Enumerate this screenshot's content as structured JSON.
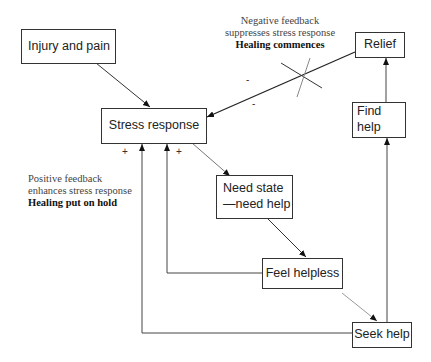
{
  "diagram": {
    "nodes": {
      "injury": "Injury and pain",
      "stress": "Stress response",
      "relief": "Relief",
      "find_help": "Find help",
      "need_state_line1": "Need state",
      "need_state_line2": "—need help",
      "feel_helpless": "Feel helpless",
      "seek_help": "Seek help"
    },
    "annotations": {
      "negative": {
        "line1": "Negative feedback",
        "line2": "suppresses stress response",
        "line3": "Healing commences"
      },
      "positive": {
        "line1": "Positive feedback",
        "line2": "enhances stress response",
        "line3": "Healing put on hold"
      }
    },
    "signs": {
      "plus_left": "+",
      "plus_right": "+",
      "minus_top": "-",
      "minus_bottom": "-"
    },
    "edges": [
      {
        "from": "Injury and pain",
        "to": "Stress response"
      },
      {
        "from": "Relief",
        "to": "Stress response",
        "type": "negative feedback (blocked)"
      },
      {
        "from": "Stress response",
        "to": "Need state —need help"
      },
      {
        "from": "Need state —need help",
        "to": "Feel helpless"
      },
      {
        "from": "Feel helpless",
        "to": "Seek help"
      },
      {
        "from": "Feel helpless",
        "to": "Stress response",
        "type": "positive feedback"
      },
      {
        "from": "Seek help",
        "to": "Stress response",
        "type": "positive feedback"
      },
      {
        "from": "Seek help",
        "to": "Find help"
      },
      {
        "from": "Find help",
        "to": "Relief"
      }
    ]
  }
}
